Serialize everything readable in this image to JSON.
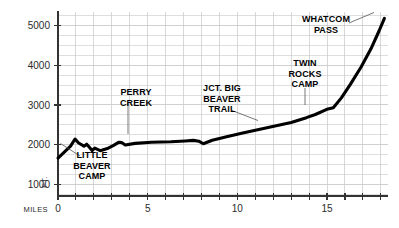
{
  "chart_data": {
    "type": "line",
    "title": "",
    "xlabel": "MILES",
    "ylabel": "FT.",
    "xlim": [
      0,
      18.4
    ],
    "ylim": [
      700,
      5350
    ],
    "grid": true,
    "grid_x_step": 1,
    "grid_y_step": 250,
    "x_tick_step": 1,
    "x_tick_labels": [
      "0",
      "5",
      "10",
      "15"
    ],
    "x_tick_label_values": [
      0,
      5,
      10,
      15
    ],
    "y_tick_labels": [
      "1000",
      "2000",
      "3000",
      "4000",
      "5000"
    ],
    "y_tick_label_values": [
      1000,
      2000,
      3000,
      4000,
      5000
    ],
    "legend": "none",
    "series": [
      {
        "name": "Little Beaver Trail elevation profile",
        "color": "#000000",
        "x": [
          0.0,
          0.35,
          0.7,
          0.95,
          1.15,
          1.45,
          1.6,
          1.75,
          1.9,
          2.05,
          2.35,
          2.75,
          3.1,
          3.4,
          3.55,
          3.75,
          4.3,
          5.2,
          6.3,
          7.1,
          7.55,
          7.85,
          8.1,
          8.6,
          9.4,
          10.3,
          11.2,
          12.1,
          13.0,
          13.85,
          14.35,
          15.05,
          15.35,
          15.8,
          16.3,
          16.9,
          17.45,
          17.9,
          18.2
        ],
        "y": [
          1660,
          1810,
          1960,
          2140,
          2040,
          1960,
          2010,
          1930,
          1850,
          1910,
          1845,
          1900,
          1980,
          2060,
          2050,
          1990,
          2030,
          2060,
          2070,
          2090,
          2105,
          2085,
          2020,
          2110,
          2200,
          2290,
          2380,
          2470,
          2560,
          2680,
          2760,
          2900,
          2930,
          3180,
          3520,
          3960,
          4420,
          4870,
          5190
        ]
      }
    ],
    "annotations": [
      {
        "id": "little-beaver-camp",
        "lines": [
          "LITTLE",
          "BEAVER",
          "CAMP"
        ],
        "text_x": 92,
        "text_y": 158,
        "align": "middle",
        "leader": {
          "x1": 60.5,
          "y1": 143.5,
          "x2": 80.0,
          "y2": 156.0
        }
      },
      {
        "id": "perry-creek",
        "lines": [
          "PERRY",
          "CREEK"
        ],
        "text_x": 136,
        "text_y": 95,
        "align": "middle",
        "leader": {
          "x1": 128.0,
          "y1": 102.0,
          "x2": 128.0,
          "y2": 134.0
        }
      },
      {
        "id": "jct-big-beaver-trail",
        "lines": [
          "JCT. BIG",
          "BEAVER",
          "TRAIL"
        ],
        "text_x": 222,
        "text_y": 91,
        "align": "middle",
        "leader": {
          "x1": 232.0,
          "y1": 110.5,
          "x2": 258.0,
          "y2": 120.5
        }
      },
      {
        "id": "twin-rocks-camp",
        "lines": [
          "TWIN",
          "ROCKS",
          "CAMP"
        ],
        "text_x": 305,
        "text_y": 66,
        "align": "middle",
        "leader": {
          "x1": 305.0,
          "y1": 88.0,
          "x2": 305.0,
          "y2": 105.0
        }
      },
      {
        "id": "whatcom-pass",
        "lines": [
          "WHATCOM",
          "PASS"
        ],
        "text_x": 326,
        "text_y": 22,
        "align": "middle",
        "leader": {
          "x1": 349.0,
          "y1": 23.0,
          "x2": 374.0,
          "y2": 12.5
        }
      }
    ],
    "colors": {
      "line": "#000000",
      "grid": "#c8c8c8",
      "axis": "#333333",
      "text": "#1a1a1a",
      "background": "#ffffff"
    }
  },
  "plot": {
    "left": 58,
    "right": 388,
    "top": 12,
    "bottom": 196
  }
}
